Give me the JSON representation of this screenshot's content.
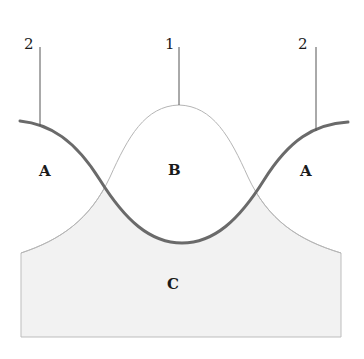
{
  "diagram": {
    "callouts": [
      {
        "id": "callout-left",
        "label": "2"
      },
      {
        "id": "callout-center",
        "label": "1"
      },
      {
        "id": "callout-right",
        "label": "2"
      }
    ],
    "regions": [
      {
        "id": "region-a-left",
        "label": "A"
      },
      {
        "id": "region-b",
        "label": "B"
      },
      {
        "id": "region-a-right",
        "label": "A"
      },
      {
        "id": "region-c",
        "label": "C"
      }
    ],
    "curves": [
      {
        "id": "curve-1",
        "description": "thin bell-shaped curve (peak up)",
        "color": "#b8b8b8"
      },
      {
        "id": "curve-2",
        "description": "thick U-shaped curve (trough down)",
        "color": "#6e6e6e"
      }
    ],
    "colors": {
      "fill_region_c": "#f2f2f2",
      "thin_line": "#b5b5b5",
      "thick_line": "#6a6a6a",
      "leader_line": "#555555",
      "text": "#1a1a1a"
    }
  }
}
